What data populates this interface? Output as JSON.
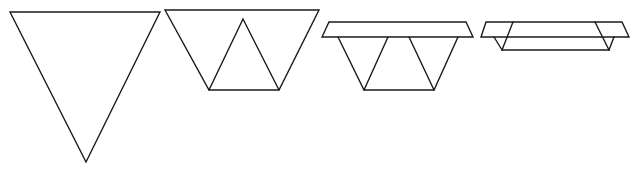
{
  "figure": {
    "stroke_color": "#1a1a1a",
    "background_color": "#ffffff",
    "steps": [
      {
        "id": "step-1",
        "label": "Inverted triangle"
      },
      {
        "id": "step-2",
        "label": "Trapezoid with inner upright triangle"
      },
      {
        "id": "step-3",
        "label": "Trapezoid with folded top flap"
      },
      {
        "id": "step-4",
        "label": "Flattened tray with side flaps"
      }
    ]
  }
}
